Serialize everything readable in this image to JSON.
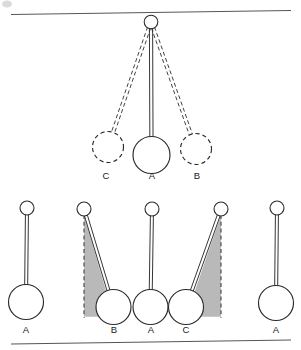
{
  "figure": {
    "background_color": "#ffffff",
    "ink_color": "#2b2b2b",
    "shade_color": "#b9b9b9",
    "rule_color": "#56565a"
  },
  "top_panel": {
    "name": "single pendulum swinging between three positions",
    "pivot": {
      "cx": 151,
      "cy": 22,
      "r": 6.8
    },
    "rule": {
      "x1": 11,
      "y1": 14.5,
      "x2": 291,
      "y2": 10.5
    },
    "positions": [
      {
        "label": "C",
        "style": "dashed",
        "bob": {
          "cx": 108,
          "cy": 147,
          "r": 15.5
        },
        "label_pos": {
          "x": 106,
          "y": 179
        }
      },
      {
        "label": "A",
        "style": "solid",
        "bob": {
          "cx": 151.5,
          "cy": 155,
          "r": 18.5
        },
        "label_pos": {
          "x": 152,
          "y": 179
        }
      },
      {
        "label": "B",
        "style": "dashed",
        "bob": {
          "cx": 196,
          "cy": 149,
          "r": 15.5
        },
        "label_pos": {
          "x": 197,
          "y": 179
        }
      }
    ]
  },
  "bottom_panel": {
    "name": "four pendulum states with swept angle shading",
    "rule": {
      "x1": 11,
      "y1": 344,
      "x2": 291,
      "y2": 340
    },
    "pendulums": [
      {
        "label": "A",
        "kind": "rest-vertical",
        "pivot": {
          "cx": 27,
          "cy": 208,
          "r": 7
        },
        "bob": {
          "cx": 26,
          "cy": 302,
          "r": 17.5
        },
        "label_pos": {
          "x": 26,
          "y": 333
        },
        "shaded": false
      },
      {
        "label": "B",
        "kind": "displaced-right",
        "pivot": {
          "cx": 84,
          "cy": 209,
          "r": 7
        },
        "bob": {
          "cx": 113.5,
          "cy": 307,
          "r": 17.5
        },
        "label_pos": {
          "x": 114,
          "y": 333
        },
        "shaded": true,
        "shade_side": "left-of-rod"
      },
      {
        "label": "A",
        "kind": "rest-vertical",
        "pivot": {
          "cx": 152,
          "cy": 209,
          "r": 7
        },
        "bob": {
          "cx": 150.5,
          "cy": 307,
          "r": 17.5
        },
        "label_pos": {
          "x": 151,
          "y": 333
        },
        "shaded": false
      },
      {
        "label": "C",
        "kind": "displaced-left",
        "pivot": {
          "cx": 221,
          "cy": 209,
          "r": 7
        },
        "bob": {
          "cx": 186,
          "cy": 307,
          "r": 17.5
        },
        "label_pos": {
          "x": 186,
          "y": 333
        },
        "shaded": true,
        "shade_side": "right-of-rod"
      },
      {
        "label": "A",
        "kind": "rest-vertical",
        "pivot": {
          "cx": 277,
          "cy": 208,
          "r": 7
        },
        "bob": {
          "cx": 276,
          "cy": 303,
          "r": 17.5
        },
        "label_pos": {
          "x": 276,
          "y": 333
        },
        "shaded": false
      }
    ]
  }
}
